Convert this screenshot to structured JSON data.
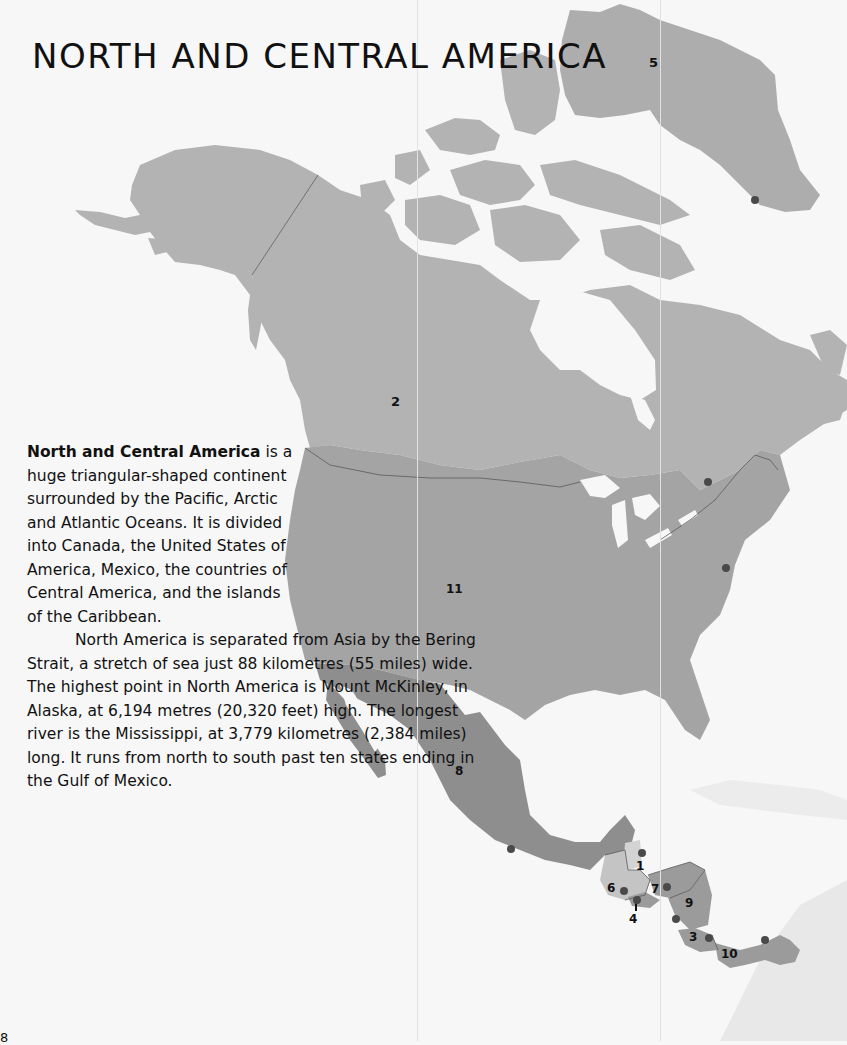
{
  "page": {
    "title": "NORTH AND CENTRAL AMERICA",
    "page_number": "8"
  },
  "body_text": {
    "lead": "North and Central America",
    "para1_rest": " is a huge triangular-shaped continent surrounded by the Pacific, Arctic and Atlantic Oceans. It is divided into Canada, the United States of America, Mexico, the countries of Central America, and the islands of the Caribbean.",
    "para2": "North America is separated from Asia by the Bering Strait, a stretch of sea just 88 kilometres (55 miles) wide. The highest point in North America is Mount McKinley, in Alaska, at 6,194 metres (20,320 feet) high. The longest river is the Mississippi, at 3,779 kilometres (2,384 miles) long. It runs from north to south past ten states ending in the Gulf of Mexico."
  },
  "map": {
    "colors": {
      "water": "#f7f7f7",
      "canada": "#b3b3b3",
      "greenland": "#adadad",
      "usa": "#a4a4a4",
      "mexico": "#8e8e8e",
      "belize": "#d3d3d3",
      "guatemala": "#c4c4c4",
      "central_other": "#9b9b9b",
      "caribbean_far": "#e6e6e6",
      "capital_dot": "#4a4a4a",
      "border": "#5a5a5a"
    },
    "labels": [
      {
        "id": "canada",
        "text": "2"
      },
      {
        "id": "greenland",
        "text": "5"
      },
      {
        "id": "usa",
        "text": "11"
      },
      {
        "id": "mexico",
        "text": "8"
      },
      {
        "id": "belize",
        "text": "1"
      },
      {
        "id": "guatemala",
        "text": "6"
      },
      {
        "id": "el-salvador",
        "text": "4"
      },
      {
        "id": "honduras",
        "text": "7"
      },
      {
        "id": "nicaragua",
        "text": "9"
      },
      {
        "id": "costa-rica",
        "text": "3"
      },
      {
        "id": "panama",
        "text": "10"
      }
    ]
  }
}
